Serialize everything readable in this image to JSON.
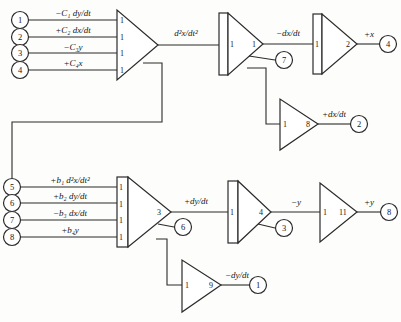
{
  "diagram": {
    "type": "analog-computer-schematic",
    "background_color": "#fdfdfb",
    "line_color": "#2b2b2b"
  },
  "top_section": {
    "input_nodes": [
      {
        "id": "1",
        "label_main": "−C",
        "label_sub": "1",
        "label_rest": " dy/dt",
        "full": "−C₁ dy/dt",
        "gain": "1"
      },
      {
        "id": "2",
        "label_main": "+C",
        "label_sub": "2",
        "label_rest": " dx/dt",
        "full": "+C₂ dx/dt",
        "gain": "1"
      },
      {
        "id": "3",
        "label_main": "−C",
        "label_sub": "3",
        "label_rest": "y",
        "full": "−C₃y",
        "gain": "1"
      },
      {
        "id": "4",
        "label_main": "+C",
        "label_sub": "4",
        "label_rest": "x",
        "full": "+C₄x",
        "gain": "1"
      }
    ],
    "summer_output_label": "d²x/dt²",
    "integrator_1": {
      "input_gain": "1",
      "output_gain": "1",
      "output_label": "−dx/dt",
      "tap_node": "7"
    },
    "integrator_2": {
      "input_gain": "1",
      "output_gain": "2",
      "output_label": "+x",
      "output_node": "4"
    },
    "amplifier_dxdt": {
      "input_gain": "1",
      "output_gain": "8",
      "output_label": "+dx/dt",
      "output_node": "2"
    }
  },
  "bottom_section": {
    "input_nodes": [
      {
        "id": "5",
        "full": "+b₁ d²x/dt²",
        "gain": "1"
      },
      {
        "id": "6",
        "full": "+b₂ dy/dt",
        "gain": "1"
      },
      {
        "id": "7",
        "full": "−b₃ dx/dt",
        "gain": "1"
      },
      {
        "id": "8",
        "full": "+b₄y",
        "gain": "1"
      }
    ],
    "summer_output_gain": "3",
    "summer_output_label": "+dy/dt",
    "summer_tap_node": "6",
    "integrator_3": {
      "input_gain": "1",
      "output_gain": "4",
      "output_label": "−y",
      "tap_node": "3"
    },
    "amplifier_y": {
      "input_gain": "1",
      "output_gain": "11",
      "output_label": "+y",
      "output_node": "8"
    },
    "amplifier_dydt": {
      "input_gain": "1",
      "output_gain": "9",
      "output_label": "−dy/dt",
      "output_node": "1"
    }
  }
}
